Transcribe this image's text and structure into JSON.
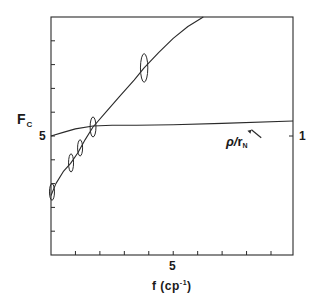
{
  "chart_data": {
    "type": "line",
    "title": "",
    "xlabel": "f (cp⁻¹)",
    "ylabel": "F_C",
    "y2label": "",
    "xlim": [
      0,
      9.9
    ],
    "ylim": [
      0,
      10
    ],
    "x_ticks": [
      0,
      1,
      2,
      3,
      4,
      5,
      6,
      7,
      8,
      9
    ],
    "x_tick_labels": {
      "5": "5"
    },
    "y_ticks": [
      1,
      2,
      3,
      4,
      5,
      6,
      7,
      8,
      9
    ],
    "y_tick_labels": {
      "5": "5"
    },
    "y2_tick_labels": {
      "5": "1"
    },
    "grid": false,
    "legend": "none",
    "annotations": [
      {
        "text": "ρ/r_N",
        "x": 7.7,
        "y": 4.8,
        "arrow_to": [
          8.2,
          5.35
        ]
      }
    ],
    "series": [
      {
        "name": "F_C (fit curve)",
        "style": "line",
        "x": [
          0.0,
          0.2,
          0.5,
          0.8,
          1.1,
          1.4,
          1.72,
          2.2,
          2.8,
          3.4,
          3.81,
          4.4,
          5.0,
          5.6,
          6.23
        ],
        "y": [
          2.5,
          3.0,
          3.5,
          3.85,
          4.3,
          4.85,
          5.38,
          5.95,
          6.65,
          7.35,
          7.86,
          8.5,
          9.1,
          9.6,
          10.0
        ]
      },
      {
        "name": "ρ/r_N",
        "style": "line",
        "x": [
          0.0,
          0.5,
          1.0,
          1.72,
          2.5,
          3.5,
          5.0,
          7.0,
          9.9
        ],
        "y": [
          5.0,
          5.15,
          5.3,
          5.42,
          5.45,
          5.45,
          5.47,
          5.53,
          5.63
        ]
      },
      {
        "name": "measured F_C (error ellipses)",
        "style": "ellipse",
        "x": [
          0.04,
          0.82,
          1.19,
          1.72,
          3.81
        ],
        "y": [
          2.65,
          3.87,
          4.5,
          5.38,
          7.86
        ],
        "y_err": [
          0.35,
          0.38,
          0.34,
          0.42,
          0.6
        ],
        "x_err": [
          0.1,
          0.1,
          0.1,
          0.12,
          0.15
        ]
      }
    ]
  },
  "labels": {
    "ylabel_main": "F",
    "ylabel_sub": "C",
    "ytick_left": "5",
    "ytick_right": "1",
    "xtick": "5",
    "xlabel_main": "f  (cp",
    "xlabel_sup": "-1",
    "xlabel_end": ")",
    "annot_rho": "ρ/",
    "annot_r": "r",
    "annot_sub": "N"
  }
}
